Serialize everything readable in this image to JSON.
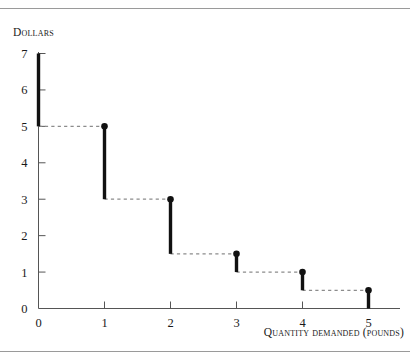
{
  "figure": {
    "background_color": "#ffffff",
    "rule_color": "#9a9a9a",
    "ink_color": "#111111",
    "dash_color": "#8c8c8c"
  },
  "chart_data": {
    "type": "line",
    "title": "",
    "subtitle": "",
    "xlabel": "Quantity demanded (pounds)",
    "ylabel": "Dollars",
    "xlim": [
      0,
      5
    ],
    "ylim": [
      0,
      7
    ],
    "grid": false,
    "legend": "none",
    "x_ticks": [
      "0",
      "1",
      "2",
      "3",
      "4",
      "5"
    ],
    "x_tick_values": [
      0,
      1,
      2,
      3,
      4,
      5
    ],
    "y_ticks": [
      "0",
      "1",
      "2",
      "3",
      "4",
      "5",
      "6",
      "7"
    ],
    "y_tick_values": [
      0,
      1,
      2,
      3,
      4,
      5,
      6,
      7
    ],
    "series": [
      {
        "name": "Demand (step)",
        "style": "step-decreasing",
        "marker": "filled-circle",
        "x": [
          0,
          1,
          2,
          3,
          4,
          5
        ],
        "values": [
          7,
          5,
          3,
          1.5,
          1,
          0.5
        ],
        "step_risers": [
          {
            "x": 0,
            "top": 7,
            "bottom": 5,
            "marker": false
          },
          {
            "x": 1,
            "top": 5,
            "bottom": 3,
            "marker": true
          },
          {
            "x": 2,
            "top": 3,
            "bottom": 1.5,
            "marker": true
          },
          {
            "x": 3,
            "top": 1.5,
            "bottom": 1,
            "marker": true
          },
          {
            "x": 4,
            "top": 1,
            "bottom": 0.5,
            "marker": true
          },
          {
            "x": 5,
            "top": 0.5,
            "bottom": 0,
            "marker": true
          }
        ],
        "step_treads": [
          {
            "y": 5,
            "x_from": 0,
            "x_to": 1,
            "dashed": true
          },
          {
            "y": 3,
            "x_from": 1,
            "x_to": 2,
            "dashed": true
          },
          {
            "y": 1.5,
            "x_from": 2,
            "x_to": 3,
            "dashed": true
          },
          {
            "y": 1,
            "x_from": 3,
            "x_to": 4,
            "dashed": true
          },
          {
            "y": 0.5,
            "x_from": 4,
            "x_to": 5,
            "dashed": true
          }
        ]
      }
    ]
  }
}
